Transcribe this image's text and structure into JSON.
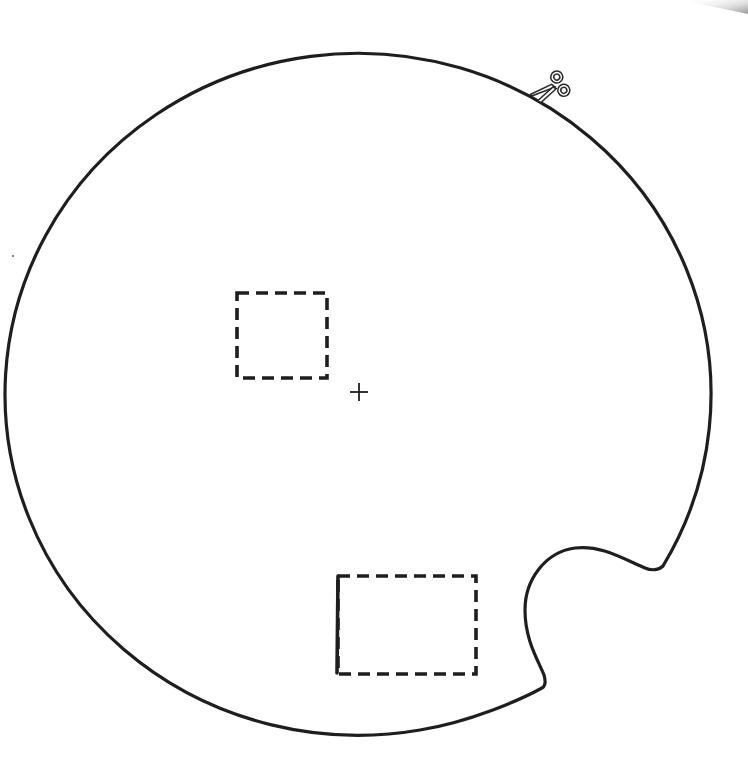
{
  "template": {
    "title": "Circular cut-out template",
    "shape": "circle-with-notch",
    "stroke_color": "#1e1e1e",
    "background_color": "#ffffff",
    "marks": [
      {
        "type": "cut-line",
        "style": "solid",
        "label": "outer-outline"
      },
      {
        "type": "fold-or-cut-window",
        "style": "dashed",
        "label": "upper-square-window"
      },
      {
        "type": "fold-or-cut-window",
        "style": "dashed-with-solid-left-edge",
        "label": "lower-rectangle-window"
      },
      {
        "type": "center-mark",
        "style": "crosshair",
        "label": "center-crosshair"
      }
    ],
    "icons": {
      "cut_indicator": "scissors-icon"
    },
    "page_curl_shading": "#b8b8b8"
  }
}
